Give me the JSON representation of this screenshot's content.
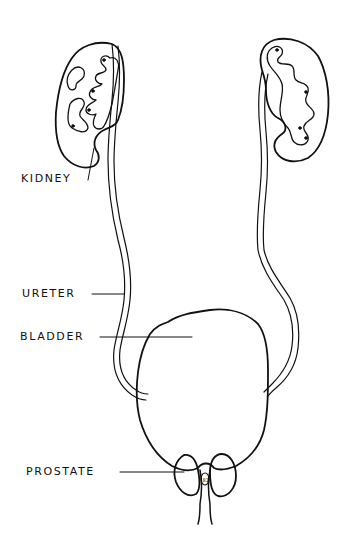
{
  "diagram": {
    "type": "anatomical line drawing",
    "stroke_color": "#111111",
    "background_color": "#ffffff",
    "labels": [
      {
        "id": "kidney",
        "text": "KIDNEY"
      },
      {
        "id": "ureter",
        "text": "URETER"
      },
      {
        "id": "bladder",
        "text": "BLADDER"
      },
      {
        "id": "prostate",
        "text": "PROSTATE"
      }
    ]
  }
}
